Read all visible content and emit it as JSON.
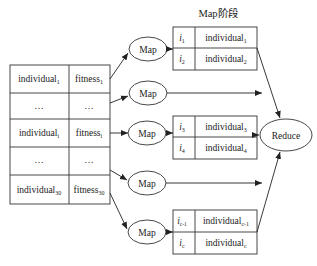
{
  "diagram": {
    "stage_label": "Map阶段",
    "population_table": {
      "rows": [
        {
          "individual": "individual",
          "individual_sub": "1",
          "fitness": "fitness",
          "fitness_sub": "1"
        },
        {
          "individual": "…",
          "individual_sub": "",
          "fitness": "…",
          "fitness_sub": ""
        },
        {
          "individual": "individual",
          "individual_sub": "i",
          "fitness": "fitness",
          "fitness_sub": "i"
        },
        {
          "individual": "…",
          "individual_sub": "",
          "fitness": "…",
          "fitness_sub": ""
        },
        {
          "individual": "individual",
          "individual_sub": "30",
          "fitness": "fitness",
          "fitness_sub": "30"
        }
      ]
    },
    "map_nodes": [
      {
        "label": "Map"
      },
      {
        "label": "Map"
      },
      {
        "label": "Map"
      },
      {
        "label": "Map"
      },
      {
        "label": "Map"
      }
    ],
    "map_outputs": [
      {
        "rows": [
          {
            "key": "i",
            "key_sub": "1",
            "value": "individual",
            "value_sub": "1"
          },
          {
            "key": "i",
            "key_sub": "2",
            "value": "individual",
            "value_sub": "2"
          }
        ]
      },
      {
        "rows": [
          {
            "key": "i",
            "key_sub": "3",
            "value": "individual",
            "value_sub": "3"
          },
          {
            "key": "i",
            "key_sub": "4",
            "value": "individual",
            "value_sub": "4"
          }
        ]
      },
      {
        "rows": [
          {
            "key": "i",
            "key_sub": "c-1",
            "value": "individual",
            "value_sub": "c-1"
          },
          {
            "key": "i",
            "key_sub": "c",
            "value": "individual",
            "value_sub": "c"
          }
        ]
      }
    ],
    "reduce_node": {
      "label": "Reduce"
    },
    "colors": {
      "stroke": "#333333",
      "text": "#222222",
      "background": "#ffffff"
    }
  }
}
